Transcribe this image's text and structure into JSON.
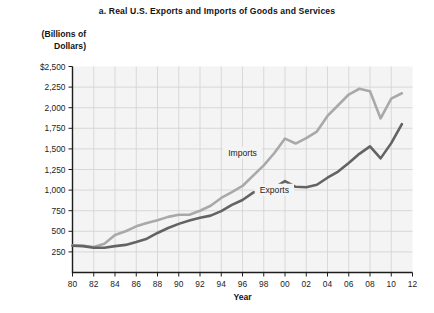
{
  "figure": {
    "title": "a. Real U.S. Exports and Imports of Goods and Services",
    "y_caption_line1": "(Billions of",
    "y_caption_line2": "Dollars)",
    "x_caption": "Year"
  },
  "chart_data": {
    "type": "line",
    "title": "a. Real U.S. Exports and Imports of Goods and Services",
    "xlabel": "Year",
    "ylabel": "(Billions of Dollars)",
    "xlim": [
      1980,
      2012
    ],
    "ylim": [
      0,
      2500
    ],
    "ytick_values": [
      250,
      500,
      750,
      1000,
      1250,
      1500,
      1750,
      2000,
      2250,
      2500
    ],
    "ytick_labels": [
      "250",
      "500",
      "750",
      "1,000",
      "1,250",
      "1,500",
      "1,750",
      "2,000",
      "2,250",
      "$2,500"
    ],
    "xtick_values": [
      1980,
      1982,
      1984,
      1986,
      1988,
      1990,
      1992,
      1994,
      1996,
      1998,
      2000,
      2002,
      2004,
      2006,
      2008,
      2010,
      2012
    ],
    "xtick_labels": [
      "80",
      "82",
      "84",
      "86",
      "88",
      "90",
      "92",
      "94",
      "96",
      "98",
      "00",
      "02",
      "04",
      "06",
      "08",
      "10",
      "12"
    ],
    "grid": true,
    "legend_position": "inline-annotations",
    "x": [
      1980,
      1981,
      1982,
      1983,
      1984,
      1985,
      1986,
      1987,
      1988,
      1989,
      1990,
      1991,
      1992,
      1993,
      1994,
      1995,
      1996,
      1997,
      1998,
      1999,
      2000,
      2001,
      2002,
      2003,
      2004,
      2005,
      2006,
      2007,
      2008,
      2009,
      2010,
      2011
    ],
    "series": [
      {
        "name": "Imports",
        "color": "#a9a9a9",
        "label_x": 1996,
        "label_y": 1430,
        "values": [
          330,
          325,
          310,
          350,
          455,
          500,
          560,
          600,
          635,
          675,
          700,
          700,
          750,
          810,
          905,
          975,
          1050,
          1175,
          1300,
          1450,
          1625,
          1565,
          1630,
          1710,
          1900,
          2030,
          2160,
          2230,
          2200,
          1870,
          2110,
          2175
        ]
      },
      {
        "name": "Exports",
        "color": "#636363",
        "label_x": 1999,
        "label_y": 980,
        "values": [
          325,
          320,
          300,
          300,
          320,
          335,
          370,
          410,
          480,
          540,
          590,
          630,
          665,
          690,
          745,
          820,
          880,
          970,
          995,
          1030,
          1110,
          1040,
          1035,
          1065,
          1150,
          1225,
          1330,
          1440,
          1530,
          1385,
          1570,
          1800
        ]
      }
    ]
  }
}
